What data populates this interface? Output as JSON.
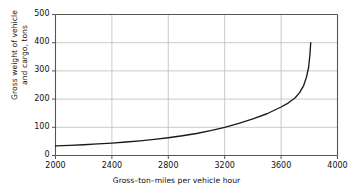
{
  "chart_data": {
    "type": "line",
    "title": "",
    "xlabel": "Gross–ton–miles per vehicle hour",
    "ylabel_line1": "Gross weight of vehicle",
    "ylabel_line2": "and cargo, tons",
    "xlim": [
      2000,
      4000
    ],
    "ylim": [
      0,
      500
    ],
    "xticks": [
      2000,
      2400,
      2800,
      3200,
      3600,
      4000
    ],
    "xtick_labels": [
      "2000",
      "2400",
      "2800",
      "3200",
      "3600",
      "4000"
    ],
    "yticks": [
      0,
      100,
      200,
      300,
      400,
      500
    ],
    "ytick_labels": [
      "0",
      "100",
      "200",
      "300",
      "400",
      "500"
    ],
    "grid": true,
    "legend": "none",
    "line_color": "#1a1a1a",
    "grid_color": "#bcbcbc",
    "frame_color": "#555555",
    "background": "#ffffff",
    "series": [
      {
        "name": "gross weight vs gross-ton-miles",
        "x": [
          2000,
          2100,
          2200,
          2300,
          2400,
          2500,
          2600,
          2700,
          2800,
          2900,
          3000,
          3100,
          3200,
          3300,
          3400,
          3500,
          3600,
          3650,
          3700,
          3730,
          3760,
          3780,
          3795,
          3805,
          3810
        ],
        "y": [
          34,
          36,
          38,
          41,
          44,
          48,
          52,
          57,
          63,
          70,
          78,
          88,
          100,
          114,
          130,
          148,
          172,
          186,
          205,
          222,
          248,
          278,
          312,
          360,
          400
        ]
      }
    ]
  }
}
